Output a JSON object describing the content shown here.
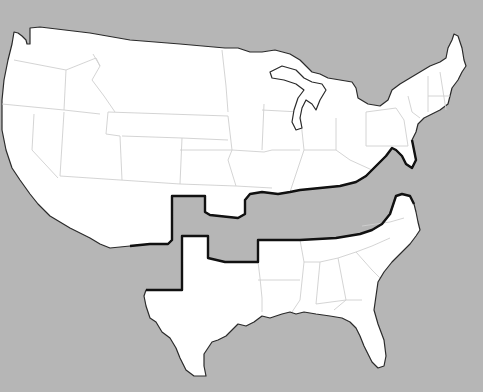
{
  "map": {
    "subject": "United States split into two parts",
    "background_color": "#b6b6b6",
    "land_color": "#ffffff",
    "border_color": "#111111",
    "state_line_color": "#cfcfcf",
    "regions": [
      {
        "name": "north",
        "description": "Northern and western states"
      },
      {
        "name": "south",
        "description": "Southern states, separated and shifted south"
      }
    ],
    "labels": []
  }
}
